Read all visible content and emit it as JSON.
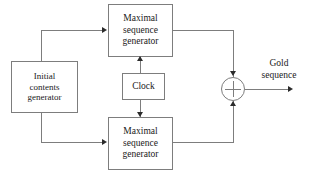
{
  "diagram": {
    "type": "block-diagram",
    "line_color": "#7d7d7d",
    "arrow_color": "#2b2b2b",
    "text_color": "#1a1a1a",
    "background": "#ffffff"
  },
  "blocks": {
    "initial_generator": {
      "line1": "Initial",
      "line2": "contents",
      "line3": "generator"
    },
    "msg_top": {
      "line1": "Maximal",
      "line2": "sequence",
      "line3": "generator"
    },
    "msg_bottom": {
      "line1": "Maximal",
      "line2": "sequence",
      "line3": "generator"
    },
    "clock": {
      "label": "Clock"
    },
    "xor": {
      "symbol": "+"
    }
  },
  "labels": {
    "output": {
      "line1": "Gold",
      "line2": "sequence"
    }
  }
}
